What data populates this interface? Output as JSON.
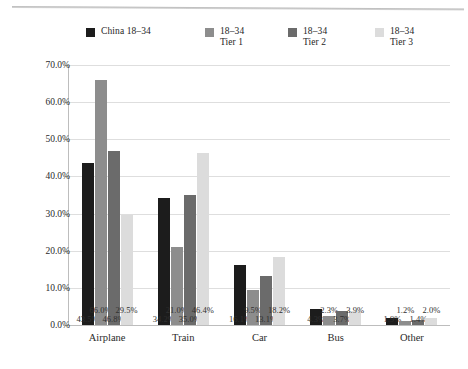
{
  "chart_data": {
    "type": "bar",
    "title": "",
    "xlabel": "",
    "ylabel": "",
    "ylim": [
      0,
      70
    ],
    "grid": true,
    "legend_position": "top",
    "categories": [
      "Airplane",
      "Train",
      "Car",
      "Bus",
      "Other"
    ],
    "ytick_labels": [
      "70.0%",
      "60.0%",
      "50.0%",
      "40.0%",
      "30.0%",
      "20.0%",
      "10.0%",
      "0.0%"
    ],
    "ytick_values": [
      70,
      60,
      50,
      40,
      30,
      20,
      10,
      0
    ],
    "series": [
      {
        "name": "China 18–34",
        "color": "#1c1c1c",
        "values": [
          43.5,
          34.2,
          16.1,
          4.3,
          1.9
        ],
        "labels": [
          "43.5%",
          "34.2%",
          "16.1%",
          "4.3%",
          "1.9%"
        ]
      },
      {
        "name": "18–34\nTier 1",
        "color": "#8d8d8d",
        "values": [
          66.0,
          21.0,
          9.5,
          2.3,
          1.2
        ],
        "labels": [
          "66.0%",
          "21.0%",
          "9.5%",
          "2.3%",
          "1.2%"
        ]
      },
      {
        "name": "18–34\nTier 2",
        "color": "#6b6b6b",
        "values": [
          46.8,
          35.0,
          13.1,
          3.7,
          1.4
        ],
        "labels": [
          "46.8%",
          "35.0%",
          "13.1%",
          "3.7%",
          "1.4%"
        ]
      },
      {
        "name": "18–34\nTier 3",
        "color": "#dcdcdc",
        "values": [
          29.5,
          46.4,
          18.2,
          3.9,
          2.0
        ],
        "labels": [
          "29.5%",
          "46.4%",
          "18.2%",
          "3.9%",
          "2.0%"
        ]
      }
    ]
  },
  "legend": {
    "items": [
      {
        "label": "China 18–34",
        "color": "#1c1c1c"
      },
      {
        "label": "18–34\nTier 1",
        "color": "#8d8d8d"
      },
      {
        "label": "18–34\nTier 2",
        "color": "#6b6b6b"
      },
      {
        "label": "18–34\nTier 3",
        "color": "#dcdcdc"
      }
    ]
  }
}
